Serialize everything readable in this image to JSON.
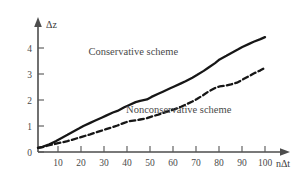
{
  "chart_data": {
    "type": "line",
    "title": "",
    "xlabel": "nΔt",
    "ylabel": "Δz",
    "xlim": [
      0,
      110
    ],
    "ylim": [
      0,
      4.8
    ],
    "grid": false,
    "legend_position": "inline-annotations",
    "xticks": [
      10,
      20,
      30,
      40,
      50,
      60,
      70,
      80,
      90,
      100
    ],
    "xtick_labels": [
      "10",
      "20",
      "30",
      "40",
      "50",
      "60",
      "70",
      "80",
      "90",
      "100"
    ],
    "yticks": [
      0,
      1,
      2,
      3,
      4
    ],
    "ytick_labels": [
      "0",
      "1",
      "2",
      "3",
      "4"
    ],
    "x": [
      0,
      2,
      5,
      8,
      10,
      13,
      15,
      18,
      20,
      23,
      25,
      28,
      30,
      33,
      35,
      38,
      40,
      43,
      45,
      48,
      50,
      53,
      55,
      58,
      60,
      63,
      65,
      68,
      70,
      73,
      75,
      78,
      80,
      83,
      85,
      88,
      90,
      93,
      95,
      98,
      100
    ],
    "series": [
      {
        "name": "Conservative scheme",
        "style": "solid",
        "color": "#161616",
        "label_position": {
          "x": 42,
          "y": 3.72
        },
        "values": [
          0.16,
          0.2,
          0.3,
          0.42,
          0.52,
          0.66,
          0.76,
          0.9,
          1.0,
          1.12,
          1.2,
          1.32,
          1.4,
          1.52,
          1.58,
          1.72,
          1.8,
          1.92,
          1.97,
          2.02,
          2.12,
          2.24,
          2.32,
          2.44,
          2.52,
          2.64,
          2.72,
          2.86,
          2.96,
          3.12,
          3.24,
          3.42,
          3.56,
          3.7,
          3.8,
          3.94,
          4.04,
          4.16,
          4.24,
          4.34,
          4.42
        ]
      },
      {
        "name": "Nonconservative scheme",
        "style": "dashed",
        "color": "#161616",
        "label_position": {
          "x": 62,
          "y": 1.52
        },
        "values": [
          0.16,
          0.19,
          0.26,
          0.32,
          0.36,
          0.42,
          0.47,
          0.55,
          0.6,
          0.68,
          0.74,
          0.82,
          0.88,
          0.96,
          1.02,
          1.12,
          1.18,
          1.22,
          1.25,
          1.3,
          1.36,
          1.44,
          1.5,
          1.58,
          1.64,
          1.74,
          1.82,
          1.94,
          2.04,
          2.2,
          2.32,
          2.46,
          2.52,
          2.56,
          2.6,
          2.68,
          2.78,
          2.92,
          3.02,
          3.14,
          3.24
        ]
      }
    ],
    "annotations": [
      {
        "text": "Conservative scheme",
        "name": "conservative-scheme-label"
      },
      {
        "text": "Nonconservative scheme",
        "name": "nonconservative-scheme-label"
      }
    ]
  },
  "colors": {
    "background": "#ffffff",
    "axis": "#4d4d4d",
    "curve": "#161616",
    "text": "#4a4a4a"
  }
}
